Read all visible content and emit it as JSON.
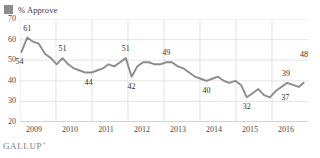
{
  "legend": {
    "swatch_icon": "legend-swatch-icon",
    "label": "% Approve",
    "color": "#8c8c8c"
  },
  "footer": {
    "brand": "GALLUP",
    "trademark": "®"
  },
  "chart_data": {
    "type": "line",
    "title": "",
    "subtitle": "",
    "xlabel": "",
    "ylabel": "",
    "legend_position": "top-left",
    "grid": true,
    "line_color": "#8c8c8c",
    "ylim": [
      20,
      70
    ],
    "xlim": [
      2009,
      2017
    ],
    "yticks": [
      70,
      60,
      50,
      40,
      30,
      20
    ],
    "xticks": [
      2009,
      2010,
      2011,
      2012,
      2013,
      2014,
      2015,
      2016
    ],
    "xtick_labels": [
      "2009",
      "2010",
      "2011",
      "2012",
      "2013",
      "2014",
      "2015",
      "2016"
    ],
    "ytick_labels": [
      "70",
      "60",
      "50",
      "40",
      "30",
      "20"
    ],
    "series": [
      {
        "name": "% Approve",
        "x": [
          2009.04,
          2009.2,
          2009.36,
          2009.52,
          2009.7,
          2009.86,
          2010.02,
          2010.18,
          2010.34,
          2010.5,
          2010.66,
          2010.82,
          2010.98,
          2011.14,
          2011.3,
          2011.46,
          2011.62,
          2011.78,
          2011.94,
          2012.1,
          2012.26,
          2012.42,
          2012.58,
          2012.74,
          2012.9,
          2013.06,
          2013.22,
          2013.38,
          2013.54,
          2013.7,
          2013.86,
          2014.02,
          2014.18,
          2014.34,
          2014.5,
          2014.66,
          2014.82,
          2014.98,
          2015.14,
          2015.3,
          2015.46,
          2015.62,
          2015.78,
          2015.94,
          2016.1,
          2016.26,
          2016.42,
          2016.58,
          2016.74,
          2016.88
        ],
        "y": [
          54,
          61,
          59,
          58,
          53,
          51,
          48,
          51,
          48,
          46,
          45,
          44,
          44,
          45,
          46,
          48,
          47,
          49,
          51,
          42,
          47,
          49,
          49,
          48,
          48,
          49,
          49,
          47,
          46,
          44,
          42,
          41,
          40,
          41,
          42,
          40,
          39,
          40,
          38,
          32,
          34,
          36,
          33,
          32,
          35,
          37,
          39,
          38,
          37,
          39
        ]
      }
    ],
    "point_labels": [
      {
        "text": "54",
        "x": 2009.04,
        "y": 54,
        "dx": -2,
        "dy": 10
      },
      {
        "text": "61",
        "x": 2009.2,
        "y": 61,
        "dx": 0,
        "dy": -9
      },
      {
        "text": "51",
        "x": 2010.18,
        "y": 51,
        "dx": 0,
        "dy": -9
      },
      {
        "text": "44",
        "x": 2010.9,
        "y": 44,
        "dx": 0,
        "dy": 10
      },
      {
        "text": "51",
        "x": 2011.94,
        "y": 51,
        "dx": 0,
        "dy": -9
      },
      {
        "text": "42",
        "x": 2012.1,
        "y": 42,
        "dx": 0,
        "dy": 10
      },
      {
        "text": "49",
        "x": 2013.06,
        "y": 49,
        "dx": 0,
        "dy": -9
      },
      {
        "text": "40",
        "x": 2014.18,
        "y": 40,
        "dx": 0,
        "dy": 10
      },
      {
        "text": "32",
        "x": 2015.3,
        "y": 32,
        "dx": 0,
        "dy": 10
      },
      {
        "text": "39",
        "x": 2016.42,
        "y": 39,
        "dx": -1,
        "dy": -9
      },
      {
        "text": "37",
        "x": 2016.2,
        "y": 37,
        "dx": 6,
        "dy": 11
      },
      {
        "text": "48",
        "x": 2016.92,
        "y": 48,
        "dx": -1,
        "dy": -9
      }
    ],
    "end_value": 48,
    "max_value": 61,
    "min_value": 32,
    "start_value": 54
  }
}
